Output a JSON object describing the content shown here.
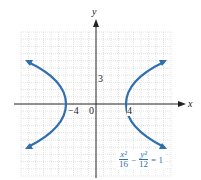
{
  "figure": {
    "x_axis_label": "x",
    "y_axis_label": "y",
    "tick_labels": {
      "x_neg": "−4",
      "origin": "0",
      "x_pos": "4",
      "y_pos": "3"
    },
    "equation": {
      "term1_num": "x²",
      "term1_den": "16",
      "minus": "−",
      "term2_num": "y²",
      "term2_den": "12",
      "rhs": "= 1"
    },
    "colors": {
      "curve": "#2f6fb0",
      "grid": "#c8c8c8",
      "axis": "#222222"
    },
    "grid": {
      "x_range": [
        -10,
        10
      ],
      "y_range": [
        -10,
        10
      ],
      "cells": 20
    },
    "curve": {
      "type": "hyperbola",
      "a_squared": 16,
      "b_squared": 12,
      "vertices": [
        [
          -4,
          0
        ],
        [
          4,
          0
        ]
      ]
    }
  }
}
